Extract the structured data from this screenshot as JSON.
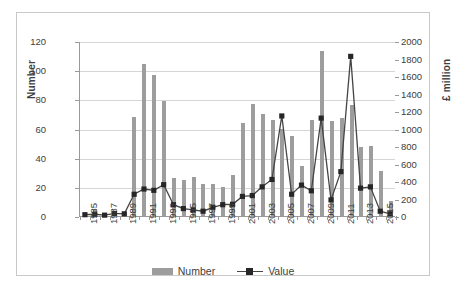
{
  "chart_data": {
    "type": "bar",
    "title": "",
    "subtitle": "",
    "xlabel": "",
    "ylabel": "Number",
    "y2label": "£ million",
    "ylim": [
      0,
      120
    ],
    "y2lim": [
      0,
      2000
    ],
    "grid": true,
    "legend_position": "bottom",
    "x": [
      1985,
      1986,
      1987,
      1988,
      1989,
      1990,
      1991,
      1992,
      1993,
      1994,
      1995,
      1996,
      1997,
      1998,
      1999,
      2000,
      2001,
      2002,
      2003,
      2004,
      2005,
      2006,
      2007,
      2008,
      2009,
      2010,
      2011,
      2012,
      2013,
      2014,
      2015,
      2016
    ],
    "xtick_labels": [
      "1985",
      "1987",
      "1989",
      "1991",
      "1993",
      "1995",
      "1997",
      "1999",
      "2001",
      "2003",
      "2005",
      "2007",
      "2009",
      "2011",
      "2013",
      "2015"
    ],
    "ytick_labels": [
      "0",
      "20",
      "40",
      "60",
      "80",
      "100",
      "120"
    ],
    "y2tick_labels": [
      "0",
      "200",
      "400",
      "600",
      "800",
      "1000",
      "1200",
      "1400",
      "1600",
      "1800",
      "2000"
    ],
    "series": [
      {
        "name": "Number",
        "axis": "left",
        "type": "bar",
        "color": "#9d9d9d",
        "values": [
          2,
          5,
          1,
          3,
          2,
          68,
          104,
          97,
          79,
          26,
          25,
          27,
          22,
          22,
          20,
          28,
          64,
          77,
          70,
          66,
          60,
          55,
          34,
          66,
          113,
          65,
          67,
          76,
          47,
          48,
          31,
          10
        ]
      },
      {
        "name": "Value",
        "axis": "right",
        "type": "line",
        "color": "#454545",
        "marker_color": "#262626",
        "values": [
          15,
          20,
          10,
          30,
          25,
          250,
          310,
          295,
          360,
          130,
          85,
          70,
          55,
          100,
          130,
          135,
          225,
          235,
          335,
          420,
          1150,
          250,
          355,
          290,
          1125,
          185,
          510,
          1835,
          320,
          335,
          55,
          25
        ]
      }
    ]
  },
  "legend": {
    "items": [
      {
        "label": "Number",
        "style": "bar"
      },
      {
        "label": "Value",
        "style": "line-marker"
      }
    ]
  },
  "axes": {
    "left_title": "Number",
    "right_title": "£ million"
  }
}
